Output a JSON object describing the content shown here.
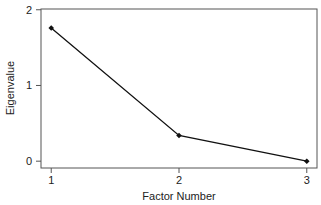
{
  "chart_data": {
    "type": "line",
    "title": "",
    "xlabel": "Factor Number",
    "ylabel": "Eigenvalue",
    "categories": [
      "1",
      "2",
      "3"
    ],
    "x": [
      1,
      2,
      3
    ],
    "series": [
      {
        "name": "Eigenvalue",
        "values": [
          1.76,
          0.34,
          0.0
        ]
      }
    ],
    "xlim": [
      0.92,
      3.08
    ],
    "ylim": [
      -0.09,
      2.01
    ],
    "xticks": [
      1,
      2,
      3
    ],
    "yticks": [
      0,
      1,
      2
    ],
    "grid": false,
    "legend": null,
    "marker": "filled-diamond",
    "line_color": "#111111"
  },
  "labels": {
    "xlabel": "Factor Number",
    "ylabel": "Eigenvalue"
  }
}
